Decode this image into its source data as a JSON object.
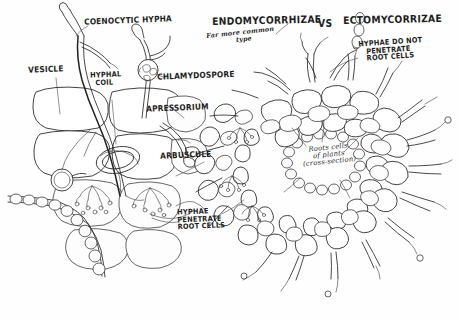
{
  "diagram": {
    "title_left": "ENDOMYCORRHIZAE",
    "title_vs": "VS",
    "title_right": "ECTOMYCORRIZAE",
    "note_common": "Far more common\n            type",
    "ink_color": "#2b2b2b",
    "background_color": "#fefefe"
  },
  "labels": {
    "coenocytic_hypha": "COENOCYTIC HYPHA",
    "vesicle": "VESICLE",
    "hyphal_coil": "HYPHAL\n  COIL",
    "chlamydospore": "CHLAMYDOSPORE",
    "appressorium": "APRESSORIUM",
    "arbuscule": "ARBUSCULE",
    "hyphae_penetrate": "HYPHAE\nPENETRATE\nROOT CELLS",
    "hyphae_do_not_penetrate": "HYPHAE DO NOT\n   PENETRATE\n   ROOT CELLS",
    "root_cells_caption": "Roots cells\nof plants\n(cross-section)"
  }
}
